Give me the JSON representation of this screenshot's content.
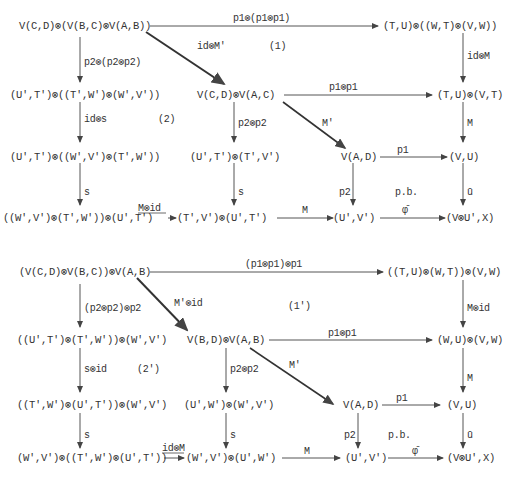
{
  "diagrams": [
    {
      "id": "top",
      "nodes": {
        "n1": "V(C,D)⊗(V(B,C)⊗V(A,B))",
        "n2": "(T,U)⊗((W,T)⊗(V,W))",
        "n3": "(U',T')⊗((T',W')⊗(W',V'))",
        "n4": "V(C,D)⊗V(A,C)",
        "n5": "(T,U)⊗(V,T)",
        "n6": "(U',T')⊗((W',V')⊗(T',W'))",
        "n7": "(U',T')⊗(T',V')",
        "n8": "V(A,D)",
        "n9": "(V,U)",
        "n10": "((W',V')⊗(T',W'))⊗(U',T')",
        "n11": "(T',V')⊗(U',T')",
        "n12": "(U',V')",
        "n13": "(V⊗U',X)"
      },
      "labels": {
        "a_n1_n2": "p1⊗(p1⊗p1)",
        "a_n1_n4": "id⊗M'",
        "region1": "(1)",
        "a_n2_n5": "id⊗M",
        "a_n1_n3": "p2⊗(p2⊗p2)",
        "a_n4_n5": "p1⊗p1",
        "a_n3_n6": "id⊗s",
        "region2": "(2)",
        "a_n4_n7": "p2⊗p2",
        "a_n4_n8": "M'",
        "a_n5_n9": "M",
        "a_n8_n9": "p1",
        "a_n6_n10": "s",
        "a_n7_n11": "s",
        "a_n8_n12": "p2",
        "pullback": "p.b.",
        "a_n9_n13": "ū",
        "a_n10_n11": "M⊗id",
        "a_n11_n12": "M",
        "a_n12_n13": "φ̄"
      }
    },
    {
      "id": "bottom",
      "nodes": {
        "n1": "(V(C,D)⊗V(B,C))⊗V(A,B)",
        "n2": "((T,U)⊗(W,T))⊗(V,W)",
        "n3": "((U',T')⊗(T',W'))⊗(W',V')",
        "n4": "V(B,D)⊗V(A,B)",
        "n5": "(W,U)⊗(V,W)",
        "n6": "((T',W')⊗(U',T'))⊗(W',V')",
        "n7": "(U',W')⊗(W',V')",
        "n8": "V(A,D)",
        "n9": "(V,U)",
        "n10": "(W',V')⊗((T',W')⊗(U',T'))",
        "n11": "(W',V')⊗(U',W')",
        "n12": "(U',V')",
        "n13": "(V⊗U',X)"
      },
      "labels": {
        "a_n1_n2": "(p1⊗p1)⊗p1",
        "a_n1_n4": "M'⊗id",
        "region1": "(1')",
        "a_n2_n5": "M⊗id",
        "a_n1_n3": "(p2⊗p2)⊗p2",
        "a_n4_n5": "p1⊗p1",
        "a_n3_n6": "s⊗id",
        "region2": "(2')",
        "a_n4_n7": "p2⊗p2",
        "a_n4_n8": "M'",
        "a_n5_n9": "M",
        "a_n8_n9": "p1",
        "a_n6_n10": "s",
        "a_n7_n11": "s",
        "a_n8_n12": "p2",
        "pullback": "p.b.",
        "a_n9_n13": "ū",
        "a_n10_n11": "id⊗M",
        "a_n11_n12": "M",
        "a_n12_n13": "φ̄"
      }
    }
  ]
}
